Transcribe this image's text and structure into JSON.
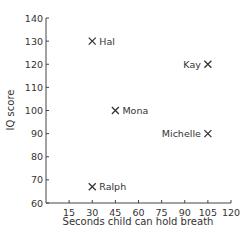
{
  "chart_data": {
    "type": "scatter",
    "title": "",
    "xlabel": "Seconds child can hold breath",
    "ylabel": "IQ score",
    "xlim": [
      0,
      120
    ],
    "ylim": [
      60,
      140
    ],
    "xticks": [
      15,
      30,
      45,
      60,
      75,
      90,
      105,
      120
    ],
    "yticks": [
      60,
      70,
      80,
      90,
      100,
      110,
      120,
      130,
      140
    ],
    "grid": false,
    "marker": "x",
    "points": [
      {
        "label": "Hal",
        "x": 30,
        "y": 130,
        "label_side": "right"
      },
      {
        "label": "Kay",
        "x": 105,
        "y": 120,
        "label_side": "left"
      },
      {
        "label": "Mona",
        "x": 45,
        "y": 100,
        "label_side": "right"
      },
      {
        "label": "Michelle",
        "x": 105,
        "y": 90,
        "label_side": "left"
      },
      {
        "label": "Ralph",
        "x": 30,
        "y": 67,
        "label_side": "right"
      }
    ]
  }
}
